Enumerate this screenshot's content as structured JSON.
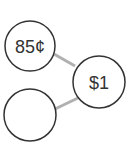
{
  "diagram": {
    "type": "number-bond",
    "nodes": [
      {
        "id": "part1",
        "label": "85¢",
        "cx": 30,
        "cy": 46,
        "r": 25
      },
      {
        "id": "whole",
        "label": "$1",
        "cx": 99,
        "cy": 82,
        "r": 26
      },
      {
        "id": "part2",
        "label": "",
        "cx": 30,
        "cy": 115,
        "r": 26
      }
    ],
    "edges": [
      {
        "from": "part1",
        "to": "whole"
      },
      {
        "from": "part2",
        "to": "whole"
      }
    ],
    "colors": {
      "circle_stroke": "#333333",
      "edge": "#b0b0b0",
      "text": "#333333"
    }
  }
}
